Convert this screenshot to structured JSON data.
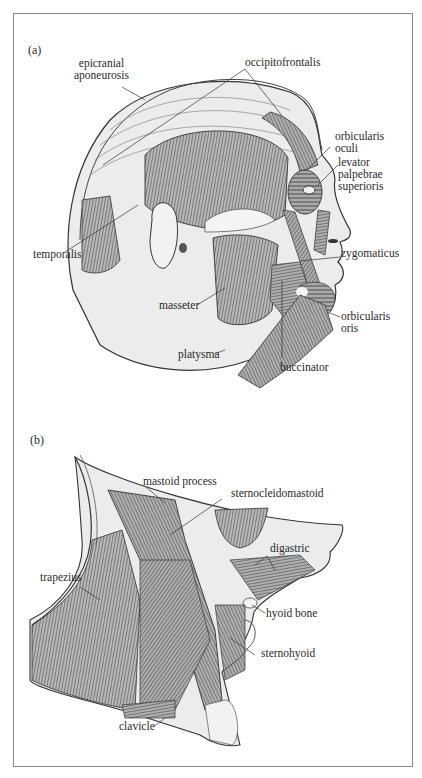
{
  "figure": {
    "panel_a": {
      "label": "(a)",
      "structures": {
        "epicranial_aponeurosis": [
          "epicranial",
          "aponeurosis"
        ],
        "occipitofrontalis": "occipitofrontalis",
        "orbicularis_oculi": [
          "orbicularis",
          "oculi"
        ],
        "levator_palpebrae_superioris": [
          "levator",
          "palpebrae",
          "superioris"
        ],
        "temporalis": "temporalis",
        "zygomaticus": "zygomaticus",
        "masseter": "masseter",
        "orbicularis_oris": [
          "orbicularis",
          "oris"
        ],
        "platysma": "platysma",
        "buccinator": "buccinator"
      }
    },
    "panel_b": {
      "label": "(b)",
      "structures": {
        "mastoid_process": "mastoid process",
        "sternocleidomastoid": "sternocleidomastoid",
        "digastric": "digastric",
        "trapezius": "trapezius",
        "hyoid_bone": "hyoid bone",
        "sternohyoid": "sternohyoid",
        "clavicle": "clavicle"
      }
    },
    "colors": {
      "frame": "#8a8a8a",
      "skin_fill": "#ebebeb",
      "muscle_fill": "#9a9a9a",
      "muscle_stroke": "#3a3a3a",
      "text": "#2a2a2a"
    }
  }
}
